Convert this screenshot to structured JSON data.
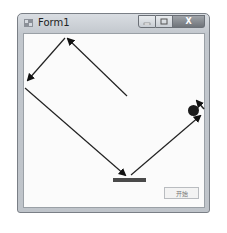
{
  "window": {
    "title": "Form1",
    "icon": "form-icon",
    "caption_buttons": {
      "minimize_icon": "minimize-icon",
      "maximize_icon": "maximize-icon",
      "close_label": "X"
    }
  },
  "client": {
    "button_label": "开始",
    "paddle": "paddle",
    "ball": "ball"
  },
  "annotations": {
    "arrows": [
      {
        "name": "arrow-1",
        "from": "start",
        "to": "top-wall"
      },
      {
        "name": "arrow-2",
        "from": "top-wall",
        "to": "left-wall"
      },
      {
        "name": "arrow-3",
        "from": "left-wall",
        "to": "paddle"
      },
      {
        "name": "arrow-4",
        "from": "paddle",
        "to": "ball"
      },
      {
        "name": "arrow-5",
        "from": "pointer",
        "to": "ball"
      }
    ]
  }
}
